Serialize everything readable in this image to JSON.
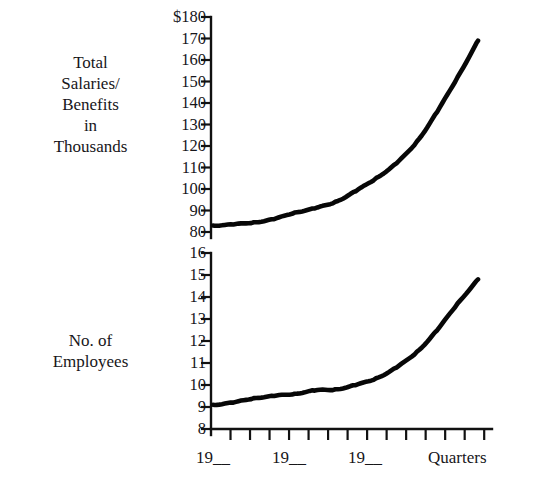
{
  "figure": {
    "title": "",
    "background": "#ffffff",
    "ink_color": "#111111"
  },
  "panels": {
    "upper": {
      "axis_label": "Total\nSalaries/\nBenefits\nin\nThousands",
      "tick_labels": [
        "$180",
        "170",
        "160",
        "150",
        "140",
        "130",
        "120",
        "110",
        "100",
        "90",
        "80"
      ]
    },
    "lower": {
      "axis_label": "No. of\nEmployees",
      "tick_labels": [
        "16",
        "15",
        "14",
        "13",
        "12",
        "11",
        "10",
        "9",
        "8"
      ]
    }
  },
  "x_axis": {
    "labels": [
      "19__",
      "19__",
      "19__",
      "Quarters"
    ],
    "tick_count": 14
  },
  "chart_data": [
    {
      "type": "line",
      "title": "",
      "xlabel": "Quarters",
      "ylabel": "Total Salaries/Benefits in Thousands",
      "ylim": [
        80,
        180
      ],
      "xlim": [
        0,
        13
      ],
      "grid": false,
      "legend": "none",
      "yticks": [
        80,
        90,
        100,
        110,
        120,
        130,
        140,
        150,
        160,
        170,
        180
      ],
      "ytick_labels": [
        "80",
        "90",
        "100",
        "110",
        "120",
        "130",
        "140",
        "150",
        "160",
        "170",
        "$180"
      ],
      "x": [
        0,
        1,
        2,
        3,
        4,
        5,
        6,
        7,
        8,
        9,
        10,
        11,
        12,
        13
      ],
      "values": [
        83,
        83.5,
        84.5,
        86,
        89,
        91,
        94,
        99,
        105,
        112,
        122,
        136,
        152,
        169
      ]
    },
    {
      "type": "line",
      "title": "",
      "xlabel": "Quarters",
      "ylabel": "No. of Employees",
      "ylim": [
        8,
        16
      ],
      "xlim": [
        0,
        13
      ],
      "grid": false,
      "legend": "none",
      "yticks": [
        8,
        9,
        10,
        11,
        12,
        13,
        14,
        15,
        16
      ],
      "ytick_labels": [
        "8",
        "9",
        "10",
        "11",
        "12",
        "13",
        "14",
        "15",
        "16"
      ],
      "x": [
        0,
        1,
        2,
        3,
        4,
        5,
        6,
        7,
        8,
        9,
        10,
        11,
        12,
        13
      ],
      "values": [
        9.1,
        9.2,
        9.4,
        9.5,
        9.6,
        9.75,
        9.8,
        10.0,
        10.3,
        10.8,
        11.5,
        12.5,
        13.7,
        14.8
      ]
    }
  ]
}
